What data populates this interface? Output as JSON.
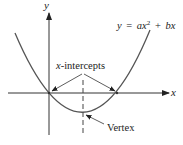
{
  "diagram": {
    "axes": {
      "x_label": "x",
      "y_label": "y"
    },
    "equation": {
      "lhs": "y",
      "eq": "=",
      "a": "a",
      "x1": "x",
      "exp": "2",
      "plus": "+",
      "b": "b",
      "x2": "x"
    },
    "annotations": {
      "intercepts_var": "x",
      "intercepts_rest": "-intercepts",
      "vertex": "Vertex"
    },
    "colors": {
      "curve": "#555555",
      "axes": "#333333",
      "text": "#222222",
      "background": "#ffffff"
    }
  }
}
